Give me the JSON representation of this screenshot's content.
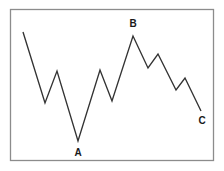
{
  "figure": {
    "background_color": "#ffffff",
    "frame": {
      "name": "chart-border",
      "x": 10,
      "y": 9,
      "width": 204,
      "height": 152,
      "stroke_color": "#8c8c8c",
      "fill_color": "#ffffff"
    }
  },
  "chart_data": {
    "type": "line",
    "title": "",
    "subtitle": "",
    "xlabel": "",
    "ylabel": "",
    "grid": false,
    "legend": null,
    "axis_ticks": [],
    "tick_labels": [],
    "line_color": "#333333",
    "line_width": 1.35,
    "xlim": [
      10,
      214
    ],
    "ylim": [
      9,
      161
    ],
    "series": [
      {
        "name": "price",
        "points": [
          {
            "x": 23,
            "y": 32
          },
          {
            "x": 45,
            "y": 103
          },
          {
            "x": 57,
            "y": 71
          },
          {
            "x": 78,
            "y": 141
          },
          {
            "x": 100,
            "y": 70
          },
          {
            "x": 112,
            "y": 101
          },
          {
            "x": 133,
            "y": 36
          },
          {
            "x": 148,
            "y": 68
          },
          {
            "x": 158,
            "y": 54
          },
          {
            "x": 176,
            "y": 90
          },
          {
            "x": 185,
            "y": 78
          },
          {
            "x": 201,
            "y": 111
          }
        ]
      }
    ],
    "annotations": [
      {
        "name": "point-label-b",
        "text": "B",
        "x": 133,
        "y": 24,
        "point_x": 133,
        "point_y": 36,
        "position": "above"
      },
      {
        "name": "point-label-a",
        "text": "A",
        "x": 78,
        "y": 153,
        "point_x": 78,
        "point_y": 141,
        "position": "below"
      },
      {
        "name": "point-label-c",
        "text": "C",
        "x": 202,
        "y": 121,
        "point_x": 201,
        "point_y": 111,
        "position": "below-right"
      }
    ]
  }
}
